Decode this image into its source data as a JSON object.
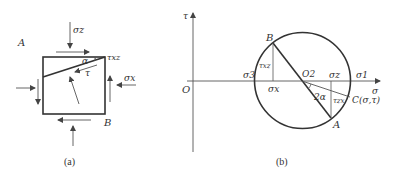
{
  "figure_a": {
    "caption": "(a)",
    "corner_top_left_label": "A",
    "corner_bottom_right_label": "B",
    "sigma_z_label": "σz",
    "sigma_x_label": "σx",
    "tau_xz_label": "τxz",
    "alpha_label": "α",
    "tau_label": "τ"
  },
  "figure_b": {
    "caption": "(b)",
    "tau_axis_label": "τ",
    "sigma_axis_label": "σ",
    "origin_label": "O",
    "center_label": "O2",
    "sigma3_label": "σ3",
    "sigma1_label": "σ1",
    "sigma_z_label": "σz",
    "sigma_x_label": "σx",
    "point_b_label": "B",
    "point_a_label": "A",
    "point_c_label": "C(σ,τ)",
    "tau_xz_label": "τxz",
    "tau_zx_label": "τzx",
    "two_alpha_label": "2α"
  },
  "colors": {
    "stroke": "#333333",
    "background": "#ffffff"
  }
}
